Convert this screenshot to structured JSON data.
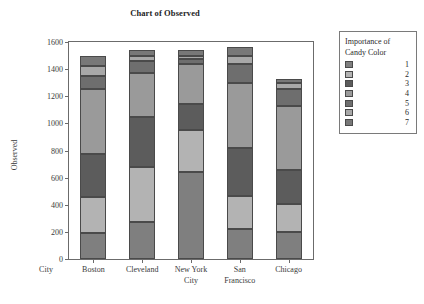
{
  "chart_data": {
    "type": "bar",
    "stacked": true,
    "title": "Chart of Observed",
    "xlabel": "City",
    "ylabel": "Observed",
    "ylim": [
      0,
      1600
    ],
    "yticks": [
      0,
      200,
      400,
      600,
      800,
      1000,
      1200,
      1400,
      1600
    ],
    "ytick_labels": [
      "0",
      "200",
      "400",
      "600",
      "800",
      "1000",
      "1200",
      "1400",
      "1600"
    ],
    "grid": false,
    "legend_position": "right",
    "legend_title": "Importance of Candy Color",
    "categories": [
      "Boston",
      "Cleveland",
      "New York City",
      "San Francisco",
      "Chicago"
    ],
    "series": [
      {
        "name": "1",
        "color": "#7f7f7f",
        "values": [
          195,
          275,
          640,
          220,
          200
        ]
      },
      {
        "name": "2",
        "color": "#b3b3b3",
        "values": [
          260,
          400,
          310,
          245,
          205
        ]
      },
      {
        "name": "3",
        "color": "#5c5c5c",
        "values": [
          320,
          370,
          190,
          350,
          250
        ]
      },
      {
        "name": "4",
        "color": "#9a9a9a",
        "values": [
          475,
          325,
          300,
          485,
          475
        ]
      },
      {
        "name": "5",
        "color": "#6e6e6e",
        "values": [
          100,
          90,
          35,
          135,
          125
        ]
      },
      {
        "name": "6",
        "color": "#a8a8a8",
        "values": [
          75,
          35,
          25,
          60,
          40
        ]
      },
      {
        "name": "7",
        "color": "#787878",
        "values": [
          75,
          45,
          40,
          70,
          30
        ]
      }
    ],
    "totals": [
      1500,
      1540,
      1540,
      1565,
      1325
    ]
  },
  "legend": {
    "title_line1": "Importance of",
    "title_line2": "Candy Color",
    "entries": [
      "1",
      "2",
      "3",
      "4",
      "5",
      "6",
      "7"
    ]
  },
  "xaxis": {
    "row_label": "City",
    "labels": [
      {
        "line1": "Boston",
        "line2": ""
      },
      {
        "line1": "Cleveland",
        "line2": ""
      },
      {
        "line1": "New York",
        "line2": "City"
      },
      {
        "line1": "San",
        "line2": "Francisco"
      },
      {
        "line1": "Chicago",
        "line2": ""
      }
    ]
  }
}
